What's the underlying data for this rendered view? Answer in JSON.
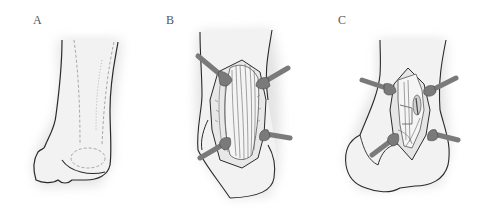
{
  "figure": {
    "panels": [
      {
        "label": "A",
        "description": "Posterior view of ankle/heel with dashed outline of planned incision and underlying structures"
      },
      {
        "label": "B",
        "description": "Incision opened with four retractors exposing tendon fibers"
      },
      {
        "label": "C",
        "description": "Deeper dissection with four retractors exposing underlying structures"
      }
    ],
    "colors": {
      "outline": "#2a2a2a",
      "skin_fill": "#f2f2f2",
      "shadow": "#d9d9d9",
      "dashed": "#a8a8a8",
      "retractor": "#7a7a7a",
      "retractor_dark": "#555555",
      "tissue": "#e4e4e4",
      "tendon_line": "#666666"
    }
  }
}
